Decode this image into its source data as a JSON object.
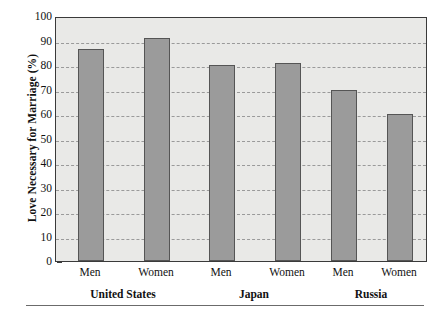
{
  "chart_data": {
    "type": "bar",
    "title": "",
    "xlabel": "",
    "ylabel": "Love Necessary for Marriage (%)",
    "ylim": [
      0,
      100
    ],
    "ytick_values": [
      0,
      10,
      20,
      30,
      40,
      50,
      60,
      70,
      80,
      90,
      100
    ],
    "ytick_labels": [
      "0",
      "10",
      "20",
      "30",
      "40",
      "50",
      "60",
      "70",
      "80",
      "90",
      "100"
    ],
    "grid": true,
    "legend": "none",
    "categories": [
      "Men",
      "Women",
      "Men",
      "Women",
      "Men",
      "Women"
    ],
    "values": [
      86.5,
      91,
      80,
      81,
      70,
      60
    ],
    "groups": [
      {
        "label": "United States",
        "bars": [
          {
            "label": "Men",
            "value": 86.5
          },
          {
            "label": "Women",
            "value": 91
          }
        ]
      },
      {
        "label": "Japan",
        "bars": [
          {
            "label": "Men",
            "value": 80
          },
          {
            "label": "Women",
            "value": 81
          }
        ]
      },
      {
        "label": "Russia",
        "bars": [
          {
            "label": "Men",
            "value": 70
          },
          {
            "label": "Women",
            "value": 60
          }
        ]
      }
    ],
    "bar_color": "#9b9b9b",
    "bar_edge_color": "#555555",
    "plot_background": "#e9e9e7",
    "gridline_color": "#9a9a9a",
    "axis_color": "#3a3a3a"
  }
}
